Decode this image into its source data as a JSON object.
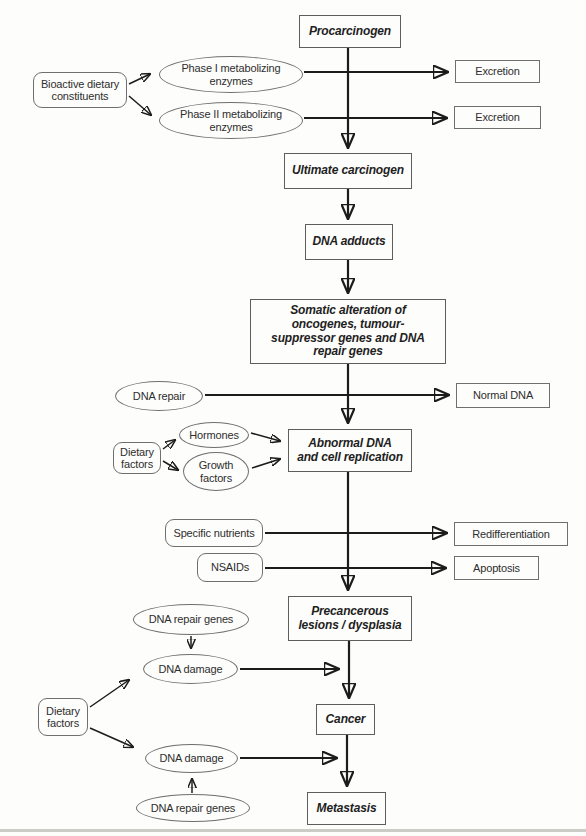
{
  "figure": {
    "type": "flowchart",
    "background_color": "#fdfdfb",
    "arrow_color": "#1c1c1c",
    "box_border_color": "#6f6f6f",
    "text_color": "#2e2e2e"
  },
  "nodes": {
    "procarcinogen": {
      "label": "Procarcinogen",
      "shape": "rect",
      "style": "bold-italic"
    },
    "bioactive_dietary_constituents": {
      "label": "Bioactive dietary constituents",
      "shape": "rounded-rect",
      "style": "regular"
    },
    "phase1_enzymes": {
      "label": "Phase I metabolizing enzymes",
      "shape": "ellipse",
      "style": "regular"
    },
    "phase2_enzymes": {
      "label": "Phase II metabolizing enzymes",
      "shape": "ellipse",
      "style": "regular"
    },
    "excretion_1": {
      "label": "Excretion",
      "shape": "rect",
      "style": "regular"
    },
    "excretion_2": {
      "label": "Excretion",
      "shape": "rect",
      "style": "regular"
    },
    "ultimate_carcinogen": {
      "label": "Ultimate carcinogen",
      "shape": "rect",
      "style": "bold-italic"
    },
    "dna_adducts": {
      "label": "DNA adducts",
      "shape": "rect",
      "style": "bold-italic"
    },
    "somatic_alteration": {
      "label": "Somatic alteration of oncogenes, tumour-suppressor genes and DNA repair genes",
      "shape": "rect",
      "style": "bold-italic"
    },
    "dna_repair": {
      "label": "DNA repair",
      "shape": "ellipse",
      "style": "regular"
    },
    "normal_dna": {
      "label": "Normal DNA",
      "shape": "rect",
      "style": "regular"
    },
    "hormones": {
      "label": "Hormones",
      "shape": "ellipse",
      "style": "regular"
    },
    "dietary_factors_1": {
      "label": "Dietary factors",
      "shape": "rounded-rect",
      "style": "regular"
    },
    "growth_factors": {
      "label": "Growth factors",
      "shape": "ellipse",
      "style": "regular"
    },
    "abnormal_dna": {
      "label": "Abnormal DNA and cell replication",
      "shape": "rect",
      "style": "bold-italic"
    },
    "specific_nutrients": {
      "label": "Specific nutrients",
      "shape": "rounded-rect",
      "style": "regular"
    },
    "redifferentiation": {
      "label": "Redifferentiation",
      "shape": "rect",
      "style": "regular"
    },
    "nsaids": {
      "label": "NSAIDs",
      "shape": "rounded-rect",
      "style": "regular"
    },
    "apoptosis": {
      "label": "Apoptosis",
      "shape": "rect",
      "style": "regular"
    },
    "precancerous_lesions": {
      "label": "Precancerous lesions / dysplasia",
      "shape": "rect",
      "style": "bold-italic"
    },
    "dna_repair_genes_1": {
      "label": "DNA repair genes",
      "shape": "ellipse",
      "style": "regular"
    },
    "dna_damage_1": {
      "label": "DNA damage",
      "shape": "ellipse",
      "style": "regular"
    },
    "dietary_factors_2": {
      "label": "Dietary factors",
      "shape": "rounded-rect",
      "style": "regular"
    },
    "cancer": {
      "label": "Cancer",
      "shape": "rect",
      "style": "bold-italic"
    },
    "dna_damage_2": {
      "label": "DNA damage",
      "shape": "ellipse",
      "style": "regular"
    },
    "dna_repair_genes_2": {
      "label": "DNA repair genes",
      "shape": "ellipse",
      "style": "regular"
    },
    "metastasis": {
      "label": "Metastasis",
      "shape": "rect",
      "style": "bold-italic"
    }
  },
  "edges": [
    {
      "from": "procarcinogen",
      "to": "ultimate_carcinogen"
    },
    {
      "from": "bioactive_dietary_constituents",
      "to": "phase1_enzymes"
    },
    {
      "from": "bioactive_dietary_constituents",
      "to": "phase2_enzymes"
    },
    {
      "from": "phase1_enzymes",
      "to": "excretion_1"
    },
    {
      "from": "phase2_enzymes",
      "to": "excretion_2"
    },
    {
      "from": "ultimate_carcinogen",
      "to": "dna_adducts"
    },
    {
      "from": "dna_adducts",
      "to": "somatic_alteration"
    },
    {
      "from": "somatic_alteration",
      "to": "abnormal_dna"
    },
    {
      "from": "dna_repair",
      "to": "normal_dna"
    },
    {
      "from": "dietary_factors_1",
      "to": "hormones"
    },
    {
      "from": "dietary_factors_1",
      "to": "growth_factors"
    },
    {
      "from": "hormones",
      "to": "abnormal_dna"
    },
    {
      "from": "growth_factors",
      "to": "abnormal_dna"
    },
    {
      "from": "abnormal_dna",
      "to": "precancerous_lesions"
    },
    {
      "from": "specific_nutrients",
      "to": "redifferentiation"
    },
    {
      "from": "nsaids",
      "to": "apoptosis"
    },
    {
      "from": "precancerous_lesions",
      "to": "cancer"
    },
    {
      "from": "dna_repair_genes_1",
      "to": "dna_damage_1"
    },
    {
      "from": "dna_damage_1",
      "to": "cancer-path"
    },
    {
      "from": "dietary_factors_2",
      "to": "dna_damage_1"
    },
    {
      "from": "dietary_factors_2",
      "to": "dna_damage_2"
    },
    {
      "from": "dna_damage_2",
      "to": "metastasis-path"
    },
    {
      "from": "dna_repair_genes_2",
      "to": "dna_damage_2"
    },
    {
      "from": "cancer",
      "to": "metastasis"
    }
  ]
}
